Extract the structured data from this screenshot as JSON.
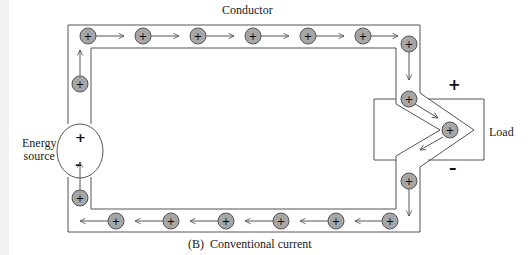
{
  "diagram": {
    "title": "Conductor",
    "caption": "(B)  Conventional current",
    "energy_source": {
      "label_line1": "Energy",
      "label_line2": "source",
      "positive_sign": "+",
      "negative_sign": "–"
    },
    "load": {
      "label": "Load",
      "positive_sign": "+",
      "negative_sign": "–"
    },
    "charge_symbol": "+",
    "colors": {
      "line": "#555555",
      "charge_fill": "#a6a6a6",
      "charge_stroke": "#555555",
      "background": "#ffffff"
    },
    "charges": {
      "top_row": [
        [
          88,
          36
        ],
        [
          143,
          36
        ],
        [
          198,
          36
        ],
        [
          253,
          36
        ],
        [
          308,
          36
        ],
        [
          363,
          36
        ]
      ],
      "right_side": [
        [
          409,
          44
        ],
        [
          409,
          99
        ],
        [
          450,
          130
        ],
        [
          409,
          181
        ]
      ],
      "bottom_row": [
        [
          390,
          221
        ],
        [
          336,
          221
        ],
        [
          281,
          221
        ],
        [
          226,
          221
        ],
        [
          171,
          221
        ],
        [
          116,
          221
        ]
      ],
      "left_side": [
        [
          80,
          198
        ],
        [
          80,
          84
        ]
      ]
    },
    "flow_direction": "clockwise (conventional current, + to –)"
  }
}
